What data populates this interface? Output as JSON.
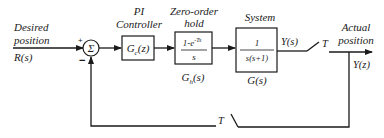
{
  "diagram": {
    "type": "block-diagram",
    "input": {
      "line1": "Desired",
      "line2": "position",
      "line3": "R(s)"
    },
    "summing_junction": {
      "symbol": "Σ",
      "plus_sign": "+",
      "minus_sign": "−"
    },
    "blocks": [
      {
        "id": "pi-controller",
        "title1": "PI",
        "title2": "Controller",
        "tf": "G",
        "tf_sub": "c",
        "tf_arg": "(z)"
      },
      {
        "id": "zero-order-hold",
        "title1": "Zero-order",
        "title2": "hold",
        "num": "1-e",
        "num_exp": "-Ts",
        "den": "s",
        "below": "G",
        "below_sub": "h",
        "below_arg": "(s)"
      },
      {
        "id": "system",
        "title1": "System",
        "num": "1",
        "den": "s(s+1)",
        "below": "G(s)"
      }
    ],
    "signals": {
      "y_s": "Y(s)",
      "sampler_top": "T",
      "sampler_bottom": "T"
    },
    "output": {
      "line1": "Actual",
      "line2": "position",
      "line3": "Y(z)"
    }
  }
}
